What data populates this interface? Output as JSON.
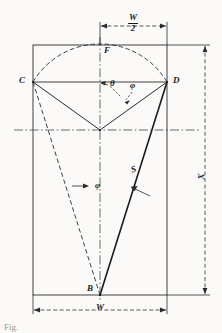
{
  "figure": {
    "type": "engineering-geometry-diagram",
    "points": {
      "C": {
        "label": "C",
        "x": 33,
        "y": 82
      },
      "D": {
        "label": "D",
        "x": 167,
        "y": 82
      },
      "F": {
        "label": "F",
        "x": 100,
        "y": 45
      },
      "B": {
        "label": "B",
        "x": 100,
        "y": 295
      },
      "O": {
        "label": "",
        "x": 100,
        "y": 130
      }
    },
    "angles": {
      "theta": {
        "label": "θ",
        "x": 110,
        "y": 87
      },
      "phi_upper": {
        "label": "φ",
        "x": 132,
        "y": 88
      },
      "phi_lower": {
        "label": "φ",
        "x": 97,
        "y": 190
      }
    },
    "segments": {
      "S": {
        "label": "S",
        "x": 133,
        "y": 172
      }
    },
    "dimensions": {
      "width_full": {
        "label": "W",
        "x": 96,
        "y": 315
      },
      "width_half_numerator": "W",
      "width_half_denominator": "2",
      "height": {
        "label": "X",
        "x": 202,
        "y": 180
      }
    },
    "colors": {
      "ink": "#1b1b1b",
      "paper": "#fbfaf8",
      "faded": "#9a9791"
    },
    "caption": "Fig."
  }
}
